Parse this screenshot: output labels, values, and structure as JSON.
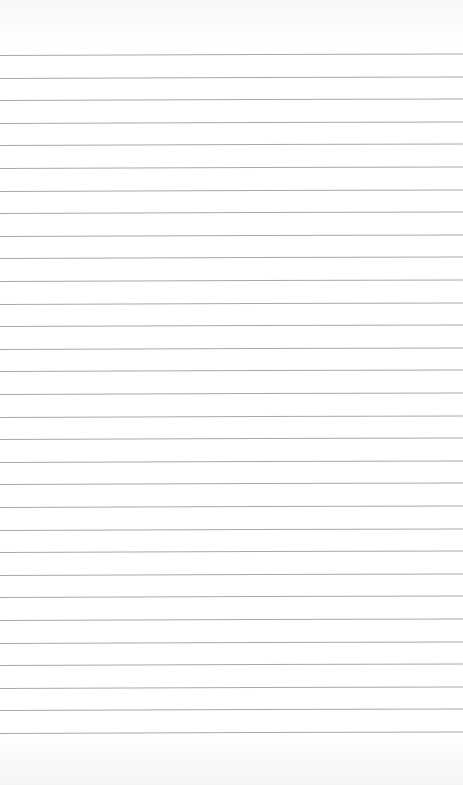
{
  "paper": {
    "type": "lined-paper",
    "line_count": 31,
    "first_line_y": 55,
    "line_spacing": 22.6,
    "line_color": "#a9a9a9",
    "background_color": "#ffffff"
  }
}
